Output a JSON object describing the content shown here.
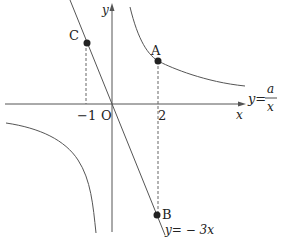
{
  "diagram": {
    "axes": {
      "x_label": "x",
      "y_label": "y",
      "origin_label": "O"
    },
    "ticks": {
      "x_neg": "−1",
      "x_pos": "2"
    },
    "points": {
      "A": {
        "label": "A",
        "x": 2
      },
      "B": {
        "label": "B",
        "x": 2
      },
      "C": {
        "label": "C",
        "x": -1
      }
    },
    "curves": {
      "hyperbola": {
        "lhs": "y=",
        "numerator": "a",
        "denominator": "x"
      },
      "line": {
        "label": "y= − 3x"
      }
    },
    "colors": {
      "stroke": "#555555",
      "point": "#222222",
      "text": "#222222"
    }
  }
}
